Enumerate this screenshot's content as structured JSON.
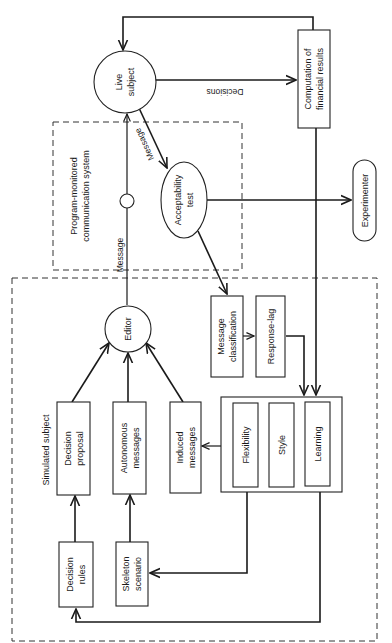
{
  "diagram": {
    "orientation": "rotated-90-clockwise",
    "nodes": {
      "live_subject": {
        "line1": "Live",
        "line2": "subject"
      },
      "computation": {
        "line1": "Computation of",
        "line2": "financial results"
      },
      "acceptability": {
        "line1": "Acceptability",
        "line2": "test"
      },
      "experimenter": {
        "label": "Experimenter"
      },
      "editor": {
        "label": "Editor"
      },
      "message_classification": {
        "line1": "Message",
        "line2": "classification"
      },
      "response_lag": {
        "label": "Response-lag"
      },
      "flexibility": {
        "label": "Flexibility"
      },
      "style": {
        "label": "Style"
      },
      "learning": {
        "label": "Learning"
      },
      "decision_proposal": {
        "line1": "Decision",
        "line2": "proposal"
      },
      "autonomous_messages": {
        "line1": "Autonomous",
        "line2": "messages"
      },
      "induced_messages": {
        "line1": "Induced",
        "line2": "messages"
      },
      "decision_rules": {
        "line1": "Decision",
        "line2": "rules"
      },
      "skeleton_scenario": {
        "line1": "Skeleton",
        "line2": "scenario"
      }
    },
    "groups": {
      "communication_system": {
        "line1": "Program-monitored",
        "line2": "communication system"
      },
      "simulated_subject": {
        "label": "Simulated subject"
      }
    },
    "edge_labels": {
      "decisions": "Decisions",
      "message_to_acceptability": "Message",
      "message_from_editor": "Message"
    }
  }
}
